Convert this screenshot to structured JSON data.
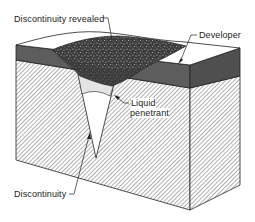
{
  "diagram": {
    "labels": {
      "discontinuity_revealed": "Discontinuity revealed",
      "developer": "Developer",
      "liquid_penetrant_line1": "Liquid",
      "liquid_penetrant_line2": "penetrant",
      "discontinuity": "Discontinuity"
    },
    "colors": {
      "developer_layer": "#5a5a5a",
      "developer_top": "#ffffff",
      "revealed_indication": "#3a3a3a",
      "hatch": "#777777",
      "penetrant": "#e6e6e6",
      "outline": "#222222"
    }
  }
}
